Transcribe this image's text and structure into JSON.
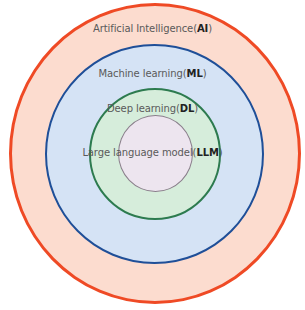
{
  "diagram": {
    "title": "",
    "type": "nested-circles",
    "layers": [
      {
        "id": "ai",
        "name": "Artificial Intelligence",
        "abbr": "AI",
        "fill": "#fcdccf",
        "stroke": "#ef4a25",
        "stroke_width": 3,
        "box": {
          "left": 9,
          "top": 3,
          "width": 292,
          "height": 301
        },
        "label_top": 23
      },
      {
        "id": "ml",
        "name": "Machine learning",
        "abbr": "ML",
        "fill": "#d5e3f5",
        "stroke": "#1f4f98",
        "stroke_width": 2.5,
        "box": {
          "left": 45,
          "top": 44,
          "width": 219,
          "height": 220
        },
        "label_top": 68
      },
      {
        "id": "dl",
        "name": "Deep learning",
        "abbr": "DL",
        "fill": "#d6eddb",
        "stroke": "#2d7b4f",
        "stroke_width": 2,
        "box": {
          "left": 89,
          "top": 88,
          "width": 132,
          "height": 132
        },
        "label_top": 103
      },
      {
        "id": "llm",
        "name": "Large language model",
        "abbr": "LLM",
        "fill": "#ede5ef",
        "stroke": "#8a7e8b",
        "stroke_width": 1,
        "box": {
          "left": 118,
          "top": 115,
          "width": 75,
          "height": 77
        },
        "label_top": 147
      }
    ]
  }
}
